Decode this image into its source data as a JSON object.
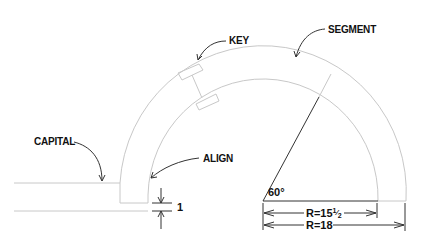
{
  "diagram": {
    "type": "arch segment construction drawing",
    "labels": {
      "key": "KEY",
      "segment": "SEGMENT",
      "capital": "CAPITAL",
      "align": "ALIGN"
    },
    "dimensions": {
      "gap": "1",
      "angle": "60°",
      "inner_radius": "R=15",
      "inner_radius_fraction_num": "1",
      "inner_radius_fraction_den": "2",
      "outer_radius": "R=18"
    },
    "colors": {
      "line": "#c8c8c8",
      "ink": "#111111",
      "background": "#ffffff"
    }
  }
}
